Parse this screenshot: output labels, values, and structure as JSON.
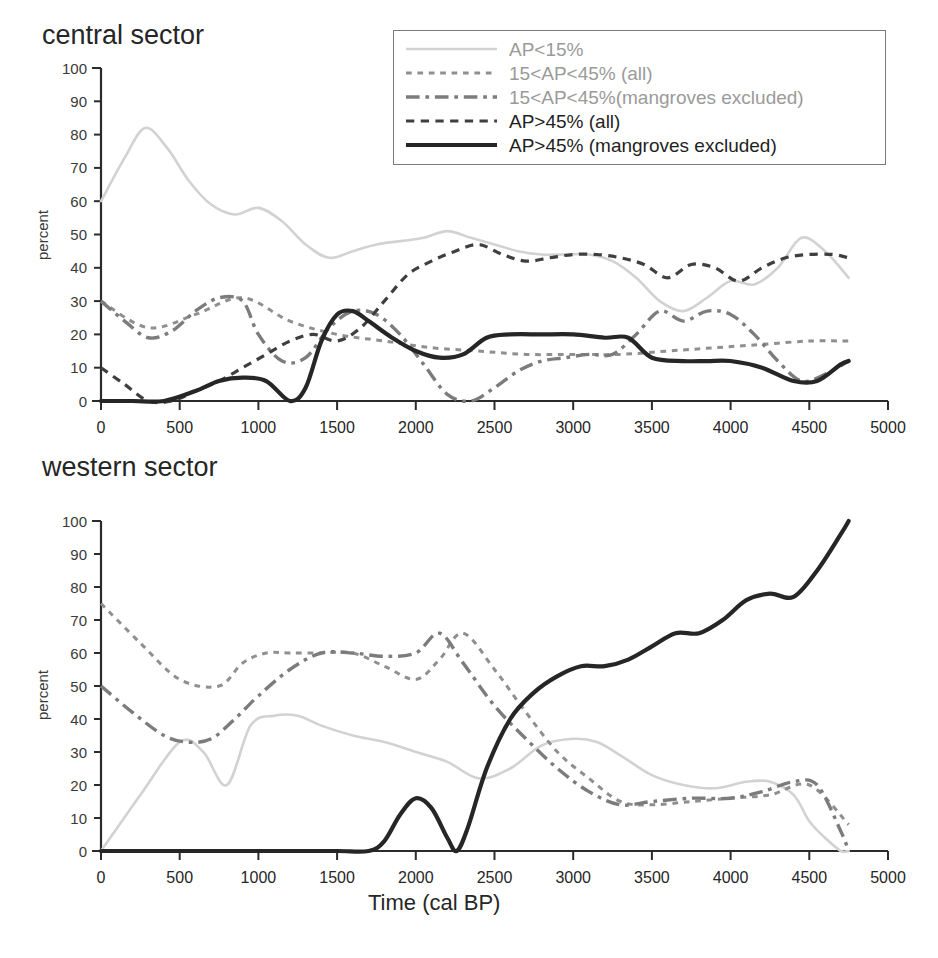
{
  "figure": {
    "xlabel": "Time (cal BP)",
    "ylabel": "percent",
    "panels": [
      {
        "title": "central sector"
      },
      {
        "title": "western sector"
      }
    ]
  },
  "legend": {
    "position": "top-right",
    "items": [
      {
        "label": "AP<15%",
        "style": "solid",
        "color": "#d2d2d2",
        "width": 2.6
      },
      {
        "label": "15<AP<45% (all)",
        "style": "dotted",
        "color": "#8f8f8f",
        "width": 3.0
      },
      {
        "label": "15<AP<45%(mangroves excluded)",
        "style": "dashdot",
        "color": "#7c7c7c",
        "width": 3.4
      },
      {
        "label": "AP>45% (all)",
        "style": "dashed",
        "color": "#3f3f3f",
        "width": 3.2
      },
      {
        "label": "AP>45% (mangroves excluded)",
        "style": "solid",
        "color": "#262626",
        "width": 4.2
      }
    ]
  },
  "chart_data": [
    {
      "type": "line",
      "title": "central sector",
      "xlabel": "",
      "ylabel": "percent",
      "xlim": [
        0,
        5000
      ],
      "ylim": [
        0,
        100
      ],
      "xticks": [
        0,
        500,
        1000,
        1500,
        2000,
        2500,
        3000,
        3500,
        4000,
        4500,
        5000
      ],
      "yticks": [
        0,
        10,
        20,
        30,
        40,
        50,
        60,
        70,
        80,
        90,
        100
      ],
      "grid": false,
      "series": [
        {
          "name": "AP<15%",
          "x": [
            0,
            150,
            280,
            420,
            560,
            700,
            850,
            1000,
            1150,
            1300,
            1450,
            1600,
            1750,
            1900,
            2050,
            2200,
            2350,
            2500,
            2650,
            2800,
            2950,
            3100,
            3250,
            3400,
            3550,
            3700,
            3850,
            4000,
            4150,
            4300,
            4450,
            4600,
            4750
          ],
          "y": [
            60,
            73,
            82,
            76,
            66,
            59,
            56,
            58,
            54,
            47,
            43,
            45,
            47,
            48,
            49,
            51,
            49,
            47,
            45,
            44,
            44,
            44,
            42,
            37,
            30,
            27,
            31,
            36,
            35,
            40,
            49,
            45,
            37
          ]
        },
        {
          "name": "15<AP<45% (all)",
          "x": [
            0,
            300,
            600,
            900,
            1200,
            1500,
            1800,
            2100,
            2400,
            2700,
            3000,
            3300,
            3600,
            3900,
            4200,
            4500,
            4750
          ],
          "y": [
            30,
            22,
            26,
            31,
            24,
            20,
            18,
            16,
            15,
            14,
            14,
            14,
            15,
            16,
            17,
            18,
            18
          ]
        },
        {
          "name": "15<AP<45%(mangroves excluded)",
          "x": [
            0,
            150,
            300,
            450,
            600,
            750,
            900,
            1000,
            1150,
            1300,
            1450,
            1600,
            1750,
            1900,
            2050,
            2200,
            2350,
            2500,
            2650,
            2800,
            2950,
            3100,
            3250,
            3400,
            3550,
            3700,
            3850,
            4000,
            4150,
            4300,
            4450,
            4600,
            4750
          ],
          "y": [
            30,
            24,
            19,
            21,
            27,
            31,
            30,
            20,
            12,
            13,
            22,
            27,
            26,
            20,
            11,
            2,
            0,
            4,
            9,
            12,
            13,
            14,
            14,
            20,
            27,
            24,
            27,
            26,
            20,
            12,
            6,
            8,
            12
          ]
        },
        {
          "name": "AP>45% (all)",
          "x": [
            0,
            150,
            300,
            450,
            600,
            750,
            900,
            1050,
            1200,
            1350,
            1500,
            1650,
            1800,
            1950,
            2100,
            2250,
            2400,
            2550,
            2700,
            2850,
            3000,
            3150,
            3300,
            3450,
            3600,
            3750,
            3900,
            4050,
            4200,
            4350,
            4500,
            4650,
            4750
          ],
          "y": [
            10,
            5,
            0,
            0,
            3,
            6,
            10,
            14,
            18,
            20,
            18,
            22,
            30,
            38,
            42,
            45,
            47,
            44,
            42,
            43,
            44,
            44,
            43,
            41,
            37,
            41,
            40,
            36,
            40,
            43,
            44,
            44,
            43
          ]
        },
        {
          "name": "AP>45% (mangroves excluded)",
          "x": [
            0,
            200,
            400,
            600,
            750,
            900,
            1050,
            1200,
            1300,
            1400,
            1500,
            1600,
            1700,
            1850,
            2000,
            2150,
            2300,
            2450,
            2600,
            2800,
            3000,
            3200,
            3350,
            3500,
            3700,
            3850,
            4000,
            4200,
            4400,
            4550,
            4700,
            4750
          ],
          "y": [
            0,
            0,
            0,
            3,
            6,
            7,
            6,
            0,
            4,
            18,
            26,
            27,
            24,
            19,
            15,
            13,
            14,
            19,
            20,
            20,
            20,
            19,
            19,
            13,
            12,
            12,
            12,
            10,
            6,
            6,
            11,
            12
          ]
        }
      ]
    },
    {
      "type": "line",
      "title": "western sector",
      "xlabel": "Time (cal BP)",
      "ylabel": "percent",
      "xlim": [
        0,
        5000
      ],
      "ylim": [
        0,
        100
      ],
      "xticks": [
        0,
        500,
        1000,
        1500,
        2000,
        2500,
        3000,
        3500,
        4000,
        4500,
        5000
      ],
      "yticks": [
        0,
        10,
        20,
        30,
        40,
        50,
        60,
        70,
        80,
        90,
        100
      ],
      "grid": false,
      "series": [
        {
          "name": "AP<15%",
          "x": [
            0,
            250,
            500,
            650,
            800,
            950,
            1100,
            1250,
            1400,
            1600,
            1800,
            2000,
            2200,
            2400,
            2600,
            2800,
            3000,
            3150,
            3300,
            3500,
            3700,
            3900,
            4100,
            4250,
            4400,
            4500,
            4600,
            4700,
            4750
          ],
          "y": [
            0,
            17,
            33,
            30,
            20,
            38,
            41,
            41,
            38,
            35,
            33,
            30,
            27,
            22,
            25,
            32,
            34,
            33,
            29,
            23,
            20,
            19,
            21,
            21,
            17,
            9,
            4,
            0,
            0
          ]
        },
        {
          "name": "15<AP<45% (all)",
          "x": [
            0,
            250,
            500,
            750,
            900,
            1050,
            1200,
            1400,
            1600,
            1800,
            2000,
            2150,
            2300,
            2500,
            2700,
            2900,
            3100,
            3300,
            3500,
            3750,
            4000,
            4250,
            4500,
            4750
          ],
          "y": [
            75,
            63,
            52,
            50,
            57,
            60,
            60,
            60,
            60,
            56,
            52,
            58,
            66,
            55,
            42,
            30,
            22,
            15,
            14,
            15,
            16,
            17,
            20,
            8
          ]
        },
        {
          "name": "15<AP<45%(mangroves excluded)",
          "x": [
            0,
            200,
            400,
            550,
            700,
            850,
            1000,
            1200,
            1400,
            1600,
            1800,
            2000,
            2150,
            2300,
            2500,
            2700,
            2900,
            3100,
            3300,
            3500,
            3750,
            4000,
            4200,
            4400,
            4550,
            4700,
            4750
          ],
          "y": [
            50,
            42,
            35,
            33,
            34,
            40,
            47,
            55,
            60,
            60,
            59,
            60,
            66,
            57,
            44,
            34,
            25,
            18,
            14,
            15,
            16,
            16,
            18,
            21,
            20,
            6,
            0
          ]
        },
        {
          "name": "AP>45% (mangroves excluded)",
          "x": [
            0,
            400,
            800,
            1200,
            1500,
            1700,
            1800,
            1900,
            2000,
            2100,
            2200,
            2260,
            2330,
            2450,
            2600,
            2750,
            2900,
            3050,
            3200,
            3350,
            3500,
            3650,
            3800,
            3950,
            4100,
            4250,
            4400,
            4550,
            4700,
            4750
          ],
          "y": [
            0,
            0,
            0,
            0,
            0,
            0,
            3,
            11,
            16,
            13,
            4,
            0,
            7,
            25,
            40,
            48,
            53,
            56,
            56,
            58,
            62,
            66,
            66,
            70,
            76,
            78,
            77,
            85,
            96,
            100
          ]
        }
      ]
    }
  ]
}
